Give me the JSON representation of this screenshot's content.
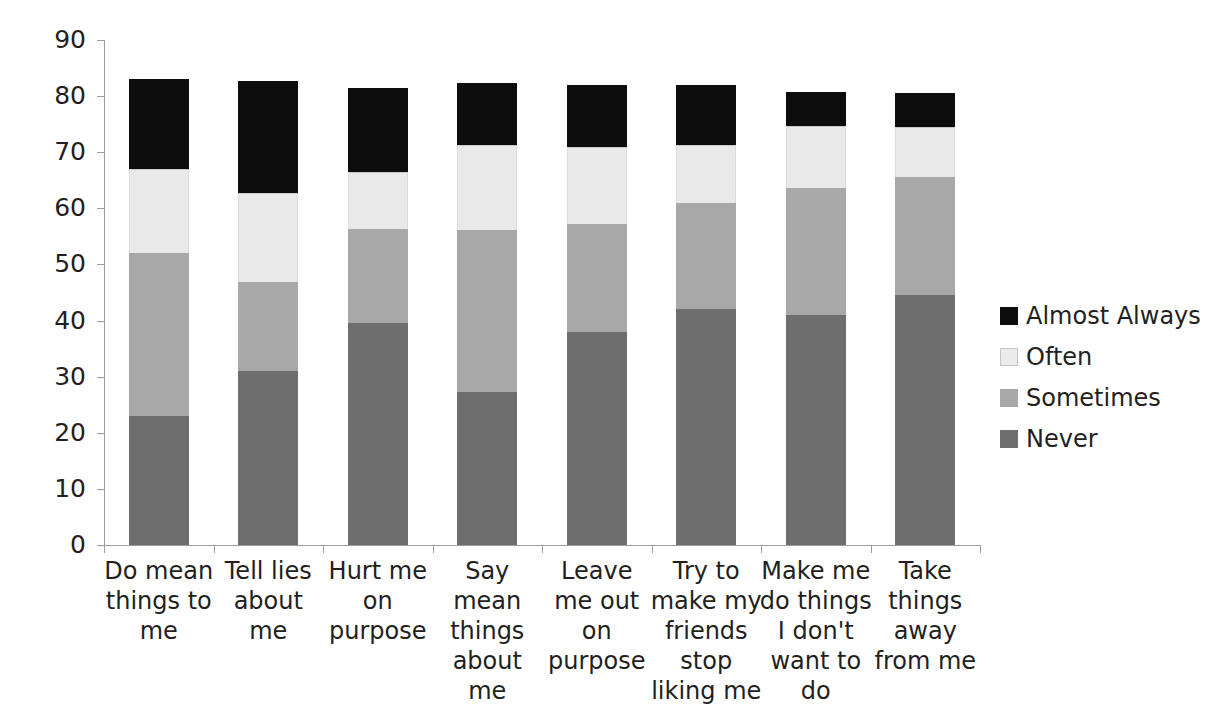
{
  "chart_data": {
    "type": "bar",
    "subtype": "stacked-column",
    "title": "",
    "subtitle": "",
    "xlabel": "",
    "ylabel": "",
    "ylim": [
      0,
      90
    ],
    "ytick_step": 10,
    "yticks": [
      "90",
      "80",
      "70",
      "60",
      "50",
      "40",
      "30",
      "20",
      "10",
      "0"
    ],
    "grid": false,
    "legend_position": "right",
    "categories": [
      "Do mean things to me",
      "Tell lies about me",
      "Hurt me on purpose",
      "Say mean things about me",
      "Leave me out on purpose",
      "Try to make my friends stop liking me",
      "Make me do things I don't want to do",
      "Take things away from me"
    ],
    "series": [
      {
        "name": "Never",
        "color": "#6e6e6e",
        "values": [
          23.0,
          31.0,
          39.5,
          27.3,
          38.0,
          42.0,
          41.0,
          44.5
        ]
      },
      {
        "name": "Sometimes",
        "color": "#a8a8a8",
        "values": [
          29.0,
          15.8,
          16.8,
          28.9,
          19.2,
          19.0,
          22.7,
          21.0
        ]
      },
      {
        "name": "Often",
        "color": "#e9e9e9",
        "values": [
          15.0,
          16.0,
          10.2,
          15.1,
          13.8,
          10.3,
          11.0,
          9.0
        ]
      },
      {
        "name": "Almost Always",
        "color": "#0d0d0d",
        "values": [
          16.0,
          19.9,
          15.0,
          11.0,
          11.0,
          10.6,
          6.0,
          6.0
        ]
      }
    ],
    "totals": [
      83.0,
      82.7,
      81.5,
      82.3,
      82.0,
      81.9,
      80.7,
      80.5
    ]
  },
  "legend": {
    "items": [
      {
        "label": "Almost Always",
        "swatch": "swatch-almost-always"
      },
      {
        "label": "Often",
        "swatch": "swatch-often"
      },
      {
        "label": "Sometimes",
        "swatch": "swatch-sometimes"
      },
      {
        "label": "Never",
        "swatch": "swatch-never"
      }
    ]
  },
  "axis": {
    "y_labels": [
      "90",
      "80",
      "70",
      "60",
      "50",
      "40",
      "30",
      "20",
      "10",
      "0"
    ]
  },
  "category_labels": [
    "Do mean things to me",
    "Tell lies about me",
    "Hurt me on purpose",
    "Say mean things about me",
    "Leave me out on purpose",
    "Try to make my friends stop liking me",
    "Make me do things I don't want to do",
    "Take things away from me"
  ]
}
